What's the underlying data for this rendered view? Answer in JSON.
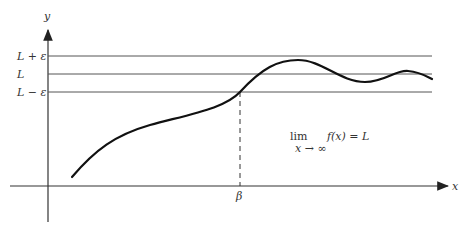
{
  "diagram": {
    "type": "limit-at-infinity",
    "axes": {
      "x_label": "x",
      "y_label": "y"
    },
    "levels": [
      {
        "name": "upper",
        "label": "L + ε"
      },
      {
        "name": "limit",
        "label": "L"
      },
      {
        "name": "lower",
        "label": "L − ε"
      }
    ],
    "beta_label": "β",
    "formula": {
      "lim": "lim",
      "sub": "x → ∞",
      "expr": "f(x) = L"
    },
    "colors": {
      "ink": "#222222",
      "lines": "#555555"
    }
  }
}
